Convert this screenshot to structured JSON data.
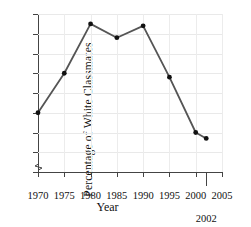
{
  "chart_data": {
    "type": "line",
    "title": "",
    "xlabel": "Year",
    "ylabel": "Percentage of White Classmates",
    "x": [
      1970,
      1975,
      1980,
      1985,
      1990,
      1995,
      2000,
      2002
    ],
    "values": [
      32.0,
      34.0,
      36.5,
      35.8,
      36.4,
      33.8,
      31.0,
      30.7
    ],
    "series": [
      {
        "name": "Percentage of White Classmates",
        "values": [
          32.0,
          34.0,
          36.5,
          35.8,
          36.4,
          33.8,
          31.0,
          30.7
        ]
      }
    ],
    "xlim": [
      1970,
      2005
    ],
    "ylim": [
      29,
      37
    ],
    "xticks": [
      "1970",
      "1975",
      "1980",
      "1985",
      "1990",
      "1995",
      "2000",
      "2005"
    ],
    "xtick_values": [
      1970,
      1975,
      1980,
      1985,
      1990,
      1995,
      2000,
      2005
    ],
    "extra_xticks": [
      {
        "label": "2002",
        "value": 2002
      }
    ],
    "yticks": [
      "29",
      "30",
      "31",
      "32",
      "33",
      "34",
      "35",
      "36",
      "37"
    ],
    "ytick_values": [
      29,
      30,
      31,
      32,
      33,
      34,
      35,
      36,
      37
    ],
    "grid": true,
    "legend": "none",
    "axis_break": "y-axis break below 29",
    "line_color": "#555555",
    "marker_color": "#111111",
    "grid_color": "#e9e9e9",
    "axis_color": "#444444"
  }
}
